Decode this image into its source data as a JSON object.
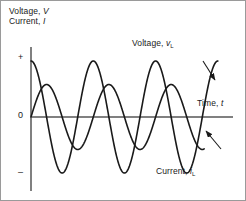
{
  "figure": {
    "background": "#ffffff",
    "border_color": "#9a9a9a",
    "axis_color": "#808080",
    "curve_color": "#1a1a1a"
  },
  "axis_titles": {
    "y_line1_prefix": "Voltage, ",
    "y_line1_symbol": "V",
    "y_line2_prefix": "Current, ",
    "y_line2_symbol": "I",
    "x_prefix": "Time, ",
    "x_symbol": "t"
  },
  "ticks": {
    "plus": "+",
    "zero": "0",
    "minus": "–"
  },
  "annotations": {
    "voltage_prefix": "Voltage, ",
    "voltage_symbol": "v",
    "voltage_subscript": "L",
    "current_prefix": "Current, ",
    "current_symbol": "i",
    "current_subscript": "L"
  },
  "chart_data": {
    "type": "line",
    "title": "",
    "xlabel": "Time, t",
    "ylabel": "Voltage, V / Current, I",
    "xlim": [
      0,
      3.05
    ],
    "ylim": [
      -1.15,
      1.15
    ],
    "grid": false,
    "legend": "inline-annotations",
    "xtick_labels": [],
    "ytick_labels": [
      "+",
      "0",
      "–"
    ],
    "ytick_values": [
      1,
      0,
      -1
    ],
    "x_unit": "periods",
    "series": [
      {
        "name": "Voltage, v_L",
        "waveform": "cosine",
        "amplitude": 1.0,
        "periods": 3.0,
        "phase_deg": 90,
        "x_start": 0,
        "x_end": 3.0,
        "annotation": "Voltage, v_L"
      },
      {
        "name": "Current, i_L",
        "waveform": "sine",
        "amplitude": 0.58,
        "periods": 3.0,
        "phase_deg": 0,
        "x_start": 0,
        "x_end": 2.78,
        "annotation": "Current, i_L",
        "lags_voltage_by_deg": 90
      }
    ],
    "annotations": [
      {
        "text": "Voltage, v_L",
        "arrow_from": [
          2.66,
          0.86
        ],
        "arrow_to": [
          2.8,
          0.52
        ]
      },
      {
        "text": "Current, i_L",
        "arrow_from": [
          2.92,
          -0.55
        ],
        "arrow_to": [
          2.74,
          -0.22
        ]
      }
    ]
  }
}
